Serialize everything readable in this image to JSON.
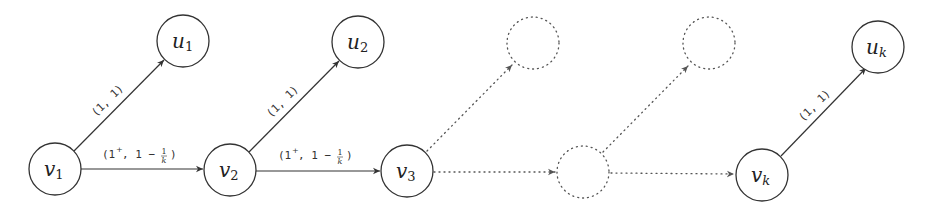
{
  "diagram": {
    "nodes": [
      {
        "id": "v1",
        "name": "v",
        "sub": "1",
        "x": 55,
        "y": 169,
        "style": "solid"
      },
      {
        "id": "u1",
        "name": "u",
        "sub": "1",
        "x": 183,
        "y": 41,
        "style": "solid"
      },
      {
        "id": "v2",
        "name": "v",
        "sub": "2",
        "x": 230,
        "y": 170,
        "style": "solid"
      },
      {
        "id": "u2",
        "name": "u",
        "sub": "2",
        "x": 358,
        "y": 42,
        "style": "solid"
      },
      {
        "id": "v3",
        "name": "v",
        "sub": "3",
        "x": 407,
        "y": 171,
        "style": "solid"
      },
      {
        "id": "d_top1",
        "name": "",
        "sub": "",
        "x": 533,
        "y": 43,
        "style": "dotted"
      },
      {
        "id": "d_bottom",
        "name": "",
        "sub": "",
        "x": 583,
        "y": 172,
        "style": "dotted"
      },
      {
        "id": "d_top2",
        "name": "",
        "sub": "",
        "x": 709,
        "y": 43,
        "style": "dotted"
      },
      {
        "id": "vk",
        "name": "v",
        "sub": "k",
        "x": 762,
        "y": 175,
        "style": "solid"
      },
      {
        "id": "uk",
        "name": "u",
        "sub": "k",
        "x": 878,
        "y": 47,
        "style": "solid"
      }
    ],
    "edges": [
      {
        "from": "v1",
        "to": "u1",
        "label": "(1, 1)",
        "style": "solid"
      },
      {
        "from": "v1",
        "to": "v2",
        "label": "(1⁺, 1 − 1/k)",
        "style": "solid"
      },
      {
        "from": "v2",
        "to": "u2",
        "label": "(1, 1)",
        "style": "solid"
      },
      {
        "from": "v2",
        "to": "v3",
        "label": "(1⁺, 1 − 1/k)",
        "style": "solid"
      },
      {
        "from": "v3",
        "to": "d_top1",
        "label": "",
        "style": "dotted"
      },
      {
        "from": "v3",
        "to": "d_bottom",
        "label": "",
        "style": "dotted"
      },
      {
        "from": "d_bottom",
        "to": "d_top2",
        "label": "",
        "style": "dotted"
      },
      {
        "from": "d_bottom",
        "to": "vk",
        "label": "",
        "style": "dotted"
      },
      {
        "from": "vk",
        "to": "uk",
        "label": "(1, 1)",
        "style": "solid"
      }
    ],
    "labels": {
      "diag_label": "(1, 1)",
      "horiz_label_prefix": "(1",
      "horiz_label_sup": "+",
      "horiz_label_mid": ", 1 − ",
      "frac_num": "1",
      "frac_den": "k",
      "horiz_label_close": ")"
    },
    "node_labels": {
      "v1": {
        "main": "v",
        "sub": "1"
      },
      "u1": {
        "main": "u",
        "sub": "1"
      },
      "v2": {
        "main": "v",
        "sub": "2"
      },
      "u2": {
        "main": "u",
        "sub": "2"
      },
      "v3": {
        "main": "v",
        "sub": "3"
      },
      "vk": {
        "main": "v",
        "sub": "k"
      },
      "uk": {
        "main": "u",
        "sub": "k"
      }
    }
  }
}
